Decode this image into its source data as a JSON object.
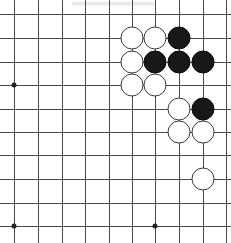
{
  "figure": {
    "title": "Go board position diagram",
    "board_type": "go-board",
    "width": 231,
    "height": 243
  },
  "board": {
    "visible_columns": 10,
    "visible_rows": 10,
    "line_color": "#4a4a4a",
    "background_color": "#ffffff",
    "stone_diameter": 23,
    "grid_spacing": 23.6,
    "x_positions": [
      14,
      38,
      62,
      85,
      109,
      132,
      155,
      179,
      203,
      226
    ],
    "y_positions": [
      14,
      38,
      62,
      85,
      109,
      132,
      155,
      179,
      203,
      226
    ],
    "star_points": [
      {
        "col": 0,
        "row": 3
      },
      {
        "col": 0,
        "row": 9
      },
      {
        "col": 6,
        "row": 9
      }
    ],
    "star_point_color": "#222222"
  },
  "stones": {
    "white_color": "#ffffff",
    "black_color": "#181818",
    "white_count": 10,
    "black_count": 5,
    "items": [
      {
        "col": 5,
        "row": 1,
        "color": "white"
      },
      {
        "col": 6,
        "row": 1,
        "color": "white"
      },
      {
        "col": 7,
        "row": 1,
        "color": "black"
      },
      {
        "col": 5,
        "row": 2,
        "color": "white"
      },
      {
        "col": 6,
        "row": 2,
        "color": "black"
      },
      {
        "col": 7,
        "row": 2,
        "color": "black"
      },
      {
        "col": 8,
        "row": 2,
        "color": "black"
      },
      {
        "col": 5,
        "row": 3,
        "color": "white"
      },
      {
        "col": 6,
        "row": 3,
        "color": "white"
      },
      {
        "col": 7,
        "row": 4,
        "color": "white"
      },
      {
        "col": 8,
        "row": 4,
        "color": "black"
      },
      {
        "col": 7,
        "row": 5,
        "color": "white"
      },
      {
        "col": 8,
        "row": 5,
        "color": "white"
      },
      {
        "col": 8,
        "row": 7,
        "color": "white"
      }
    ]
  },
  "artifact": {
    "label": "scan smudge"
  }
}
